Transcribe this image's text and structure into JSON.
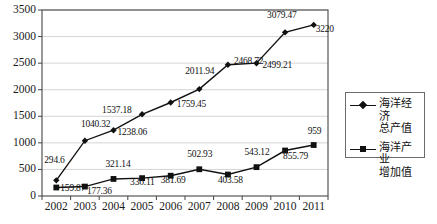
{
  "chart_data": {
    "type": "line",
    "title": "",
    "xlabel": "",
    "ylabel": "",
    "categories": [
      "2002",
      "2003",
      "2004",
      "2005",
      "2006",
      "2007",
      "2008",
      "2009",
      "2010",
      "2011"
    ],
    "ylim": [
      0,
      3500
    ],
    "ytick_step": 500,
    "yticks": [
      "0",
      "500",
      "1000",
      "1500",
      "2000",
      "2500",
      "3000",
      "3500"
    ],
    "grid": "horizontal",
    "legend_position": "right",
    "series": [
      {
        "name": "海洋经济总产值",
        "marker": "diamond",
        "color": "#111111",
        "values": [
          294.6,
          1040.32,
          1238.06,
          1537.18,
          1759.45,
          2011.94,
          2468.72,
          2499.21,
          3079.47,
          3220
        ],
        "labels": [
          "294.6",
          "1040.32",
          "1238.06",
          "1537.18",
          "1759.45",
          "2011.94",
          "2468.72",
          "2499.21",
          "3079.47",
          "3220"
        ]
      },
      {
        "name": "海洋产业增加值",
        "marker": "square",
        "color": "#111111",
        "values": [
          159.87,
          177.36,
          321.14,
          336.11,
          381.69,
          502.93,
          403.58,
          543.12,
          855.79,
          959
        ],
        "labels": [
          "159.87",
          "177.36",
          "321.14",
          "336.11",
          "381.69",
          "502.93",
          "403.58",
          "543.12",
          "855.79",
          "959"
        ]
      }
    ]
  },
  "legend": {
    "items": [
      {
        "label": "海洋经济\n总产值",
        "marker": "diamond"
      },
      {
        "label": "海洋产业\n增加值",
        "marker": "square"
      }
    ]
  }
}
